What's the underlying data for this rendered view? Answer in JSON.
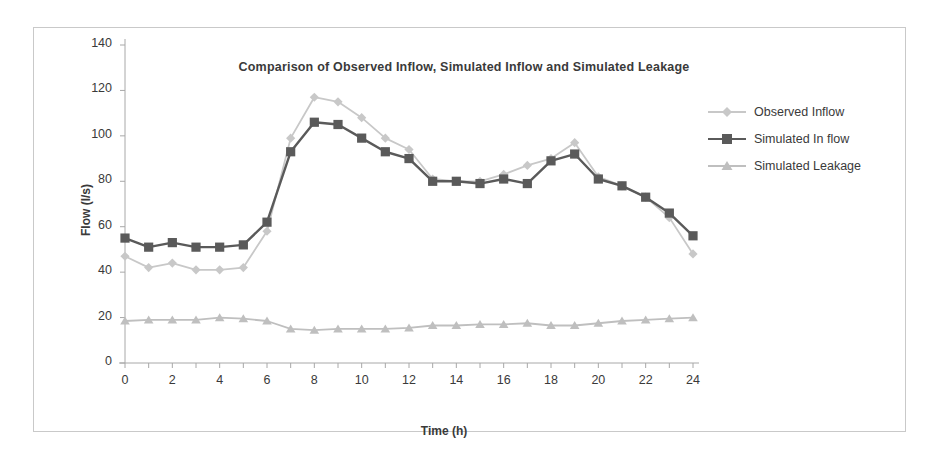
{
  "chart_data": {
    "type": "line",
    "title": "Comparison of Observed Inflow, Simulated Inflow and Simulated Leakage",
    "xlabel": "Time (h)",
    "ylabel": "Flow (l/s)",
    "xlim": [
      0,
      24
    ],
    "ylim": [
      0,
      140
    ],
    "x_ticks": [
      0,
      2,
      4,
      6,
      8,
      10,
      12,
      14,
      16,
      18,
      20,
      22,
      24
    ],
    "x_minor_tick_step": 1,
    "y_ticks": [
      0,
      20,
      40,
      60,
      80,
      100,
      120,
      140
    ],
    "grid": false,
    "legend_position": "right",
    "x": [
      0,
      1,
      2,
      3,
      4,
      5,
      6,
      7,
      8,
      9,
      10,
      11,
      12,
      13,
      14,
      15,
      16,
      17,
      18,
      19,
      20,
      21,
      22,
      23,
      24
    ],
    "series": [
      {
        "name": "Observed Inflow",
        "marker": "diamond",
        "color": "#c8c8c8",
        "values": [
          47,
          42,
          44,
          41,
          41,
          42,
          58,
          99,
          117,
          115,
          108,
          99,
          94,
          81,
          80,
          80,
          83,
          87,
          90,
          97,
          82,
          78,
          73,
          64,
          48
        ]
      },
      {
        "name": "Simulated In flow",
        "marker": "square",
        "color": "#5a5a5a",
        "values": [
          55,
          51,
          53,
          51,
          51,
          52,
          62,
          93,
          106,
          105,
          99,
          93,
          90,
          80,
          80,
          79,
          81,
          79,
          89,
          92,
          81,
          78,
          73,
          66,
          56
        ]
      },
      {
        "name": "Simulated Leakage",
        "marker": "triangle",
        "color": "#bfbfbf",
        "values": [
          18.5,
          19,
          19,
          19,
          20,
          19.5,
          18.5,
          15,
          14.5,
          15,
          15,
          15,
          15.5,
          16.5,
          16.5,
          17,
          17,
          17.5,
          16.5,
          16.5,
          17.5,
          18.5,
          19,
          19.5,
          20
        ]
      }
    ]
  },
  "legend": {
    "items": [
      {
        "label": "Observed Inflow"
      },
      {
        "label": "Simulated In flow"
      },
      {
        "label": "Simulated Leakage"
      }
    ]
  },
  "colors": {
    "frame": "#c9c9c9",
    "axis": "#a8a8a8",
    "text": "#3a3a3a",
    "observed": "#c8c8c8",
    "simulated_inflow": "#5a5a5a",
    "simulated_leakage": "#bfbfbf"
  }
}
